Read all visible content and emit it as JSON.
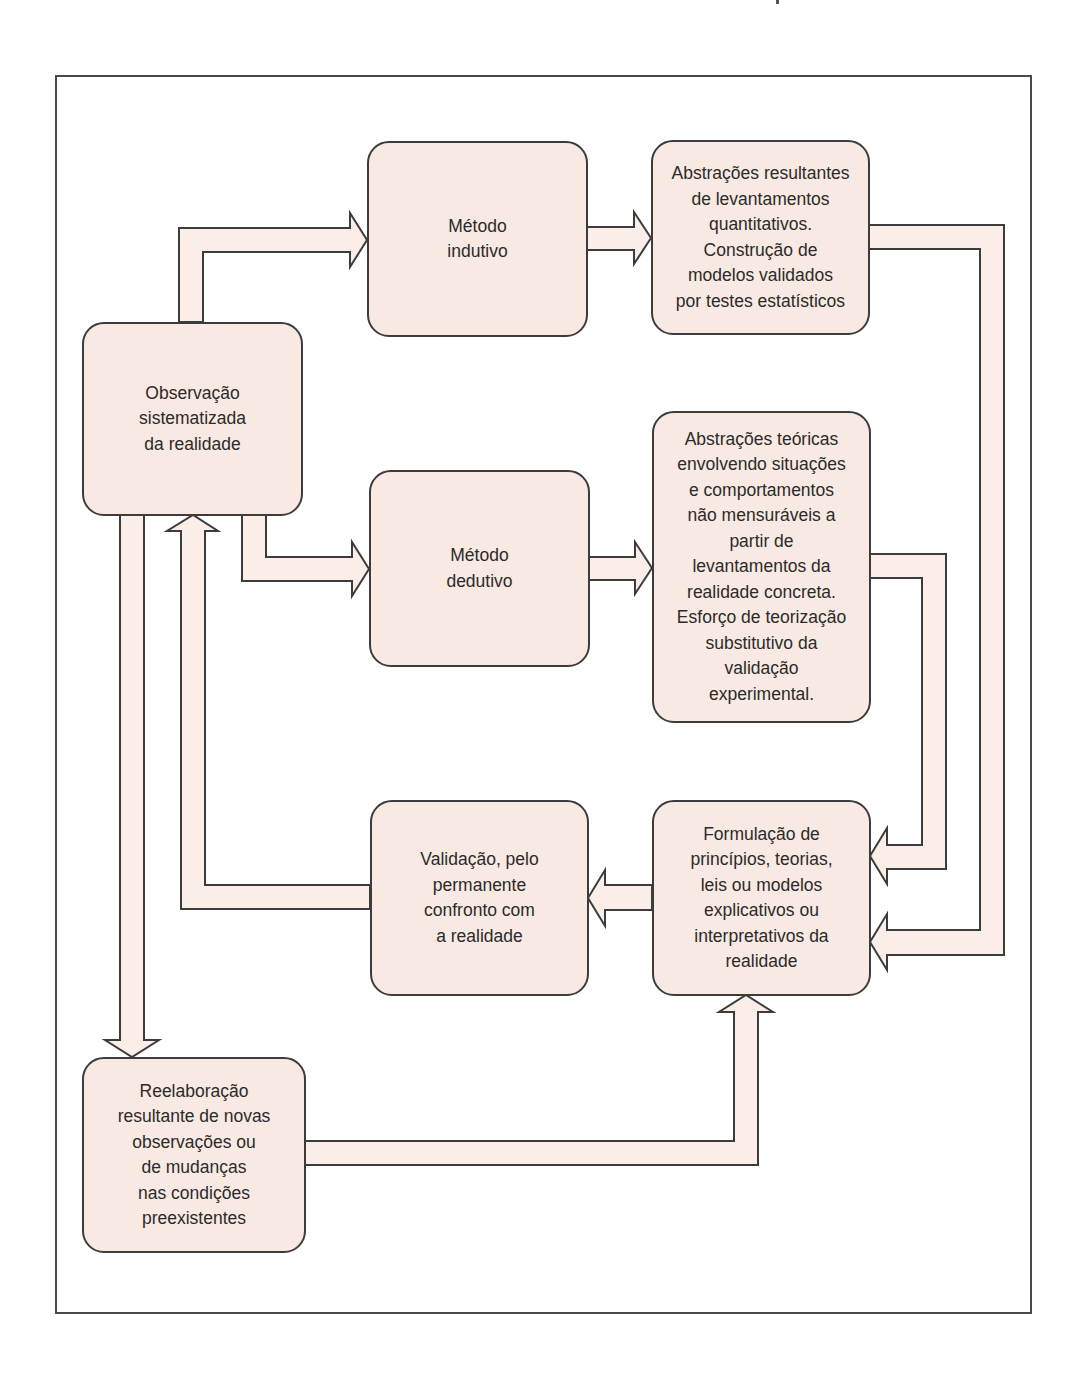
{
  "diagram": {
    "colors": {
      "box_fill": "#f8e9e2",
      "outline": "#3c3c3c",
      "arrow_fill": "#fbeee8",
      "frame": "#4a4a4a",
      "text": "#2b2b2b"
    },
    "nodes": {
      "observacao": {
        "label": "Observação\nsistematizada\nda realidade"
      },
      "metodo_indutivo": {
        "label": "Método\nindutivo"
      },
      "abstracoes_resultantes": {
        "label": "Abstrações resultantes\nde levantamentos\nquantitativos.\nConstrução de\nmodelos validados\npor testes estatísticos"
      },
      "metodo_dedutivo": {
        "label": "Método\ndedutivo"
      },
      "abstracoes_teoricas": {
        "label": "Abstrações teóricas\nenvolvendo situações\ne comportamentos\nnão mensuráveis a\npartir de\nlevantamentos da\nrealidade concreta.\nEsforço de teorização\nsubstitutivo da\nvalidação\nexperimental."
      },
      "validacao": {
        "label": "Validação, pelo\npermanente\nconfronto com\na realidade"
      },
      "formulacao": {
        "label": "Formulação de\nprincípios, teorias,\nleis ou modelos\nexplicativos ou\ninterpretativos da\nrealidade"
      },
      "reelaboracao": {
        "label": "Reelaboração\nresultante de novas\nobservações ou\nde mudanças\nnas condições\npreexistentes"
      }
    },
    "edges": [
      {
        "from": "observacao",
        "to": "metodo_indutivo"
      },
      {
        "from": "observacao",
        "to": "metodo_dedutivo"
      },
      {
        "from": "metodo_indutivo",
        "to": "abstracoes_resultantes"
      },
      {
        "from": "metodo_dedutivo",
        "to": "abstracoes_teoricas"
      },
      {
        "from": "abstracoes_resultantes",
        "to": "formulacao"
      },
      {
        "from": "abstracoes_teoricas",
        "to": "formulacao"
      },
      {
        "from": "formulacao",
        "to": "validacao"
      },
      {
        "from": "validacao",
        "to": "observacao"
      },
      {
        "from": "observacao",
        "to": "reelaboracao"
      },
      {
        "from": "reelaboracao",
        "to": "formulacao"
      }
    ]
  }
}
